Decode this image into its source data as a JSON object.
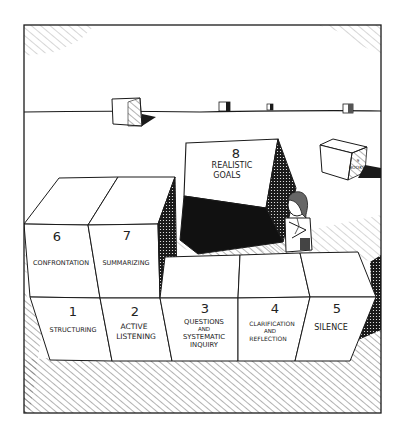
{
  "illustration": {
    "style": "pen-and-ink cartoon",
    "colors": {
      "ink": "#1a1a1a",
      "paper": "#ffffff",
      "hatch": "#555555"
    },
    "blocks": [
      {
        "number": "1",
        "label_lines": [
          "STRUCTURING"
        ]
      },
      {
        "number": "2",
        "label_lines": [
          "ACTIVE",
          "LISTENING"
        ]
      },
      {
        "number": "3",
        "label_lines": [
          "QUESTIONS",
          "AND",
          "SYSTEMATIC",
          "INQUIRY"
        ]
      },
      {
        "number": "4",
        "label_lines": [
          "CLARIFICATION",
          "AND",
          "REFLECTION"
        ]
      },
      {
        "number": "5",
        "label_lines": [
          "SILENCE"
        ]
      },
      {
        "number": "6",
        "label_lines": [
          "CONFRONTATION"
        ]
      },
      {
        "number": "7",
        "label_lines": [
          "SUMMARIZING"
        ]
      },
      {
        "number": "8",
        "label_lines": [
          "REALISTIC",
          "GOALS"
        ]
      }
    ],
    "background_box": {
      "number": "9",
      "label": "BOOKS"
    }
  }
}
